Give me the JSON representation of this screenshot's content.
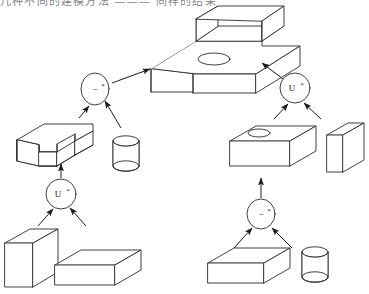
{
  "page": {
    "top_cut_text": "几种不同的建模方法 ——— 同样的结果"
  },
  "figure": {
    "background": "#ffffff",
    "stroke_color": "#2b2b2b",
    "face_color": "#ffffff",
    "arrow_color": "#1c1c1c"
  },
  "operators": [
    {
      "id": "op-difference-left",
      "symbol": "−",
      "star": "*",
      "name": "regularized-difference",
      "cx": 95,
      "cy": 89,
      "rx": 14,
      "ry": 16
    },
    {
      "id": "op-union-left",
      "symbol": "U",
      "star": "*",
      "name": "regularized-union",
      "cx": 61,
      "cy": 194,
      "rx": 15,
      "ry": 15
    },
    {
      "id": "op-union-right",
      "symbol": "U",
      "star": "*",
      "name": "regularized-union",
      "cx": 295,
      "cy": 88,
      "rx": 15,
      "ry": 15
    },
    {
      "id": "op-difference-right",
      "symbol": "−",
      "star": "*",
      "name": "regularized-difference",
      "cx": 261,
      "cy": 214,
      "rx": 14,
      "ry": 15
    }
  ],
  "solids": [
    {
      "id": "result-block",
      "label": "stepped block with through hole",
      "kind": "step-block-hole"
    },
    {
      "id": "u-channel",
      "label": "U channel",
      "kind": "u-channel"
    },
    {
      "id": "cylinder-left",
      "label": "cylinder",
      "kind": "cylinder"
    },
    {
      "id": "plate-left",
      "label": "vertical plate",
      "kind": "plate"
    },
    {
      "id": "box-left",
      "label": "rectangular box",
      "kind": "box"
    },
    {
      "id": "box-hole-right",
      "label": "box with elliptical hole",
      "kind": "box-hole"
    },
    {
      "id": "plate-right",
      "label": "vertical plate",
      "kind": "plate"
    },
    {
      "id": "box-bottom-right",
      "label": "rectangular box",
      "kind": "box"
    },
    {
      "id": "cylinder-right",
      "label": "cylinder",
      "kind": "cylinder"
    }
  ],
  "edges": [
    {
      "from": "op-difference-left",
      "to": "result-block",
      "name": "arrow-diff-left-to-result"
    },
    {
      "from": "op-union-right",
      "to": "result-block",
      "name": "arrow-union-right-to-result"
    },
    {
      "from": "u-channel",
      "to": "op-difference-left",
      "name": "arrow-uchannel-to-diff-left"
    },
    {
      "from": "cylinder-left",
      "to": "op-difference-left",
      "name": "arrow-cylinder-to-diff-left"
    },
    {
      "from": "op-union-left",
      "to": "u-channel",
      "name": "arrow-union-left-to-uchannel"
    },
    {
      "from": "plate-left",
      "to": "op-union-left",
      "name": "arrow-plate-to-union-left"
    },
    {
      "from": "box-left",
      "to": "op-union-left",
      "name": "arrow-box-to-union-left"
    },
    {
      "from": "box-hole-right",
      "to": "op-union-right",
      "name": "arrow-boxhole-to-union-right"
    },
    {
      "from": "plate-right",
      "to": "op-union-right",
      "name": "arrow-plate-to-union-right"
    },
    {
      "from": "op-difference-right",
      "to": "box-hole-right",
      "name": "arrow-diff-right-to-boxhole"
    },
    {
      "from": "box-bottom-right",
      "to": "op-difference-right",
      "name": "arrow-box-to-diff-right"
    },
    {
      "from": "cylinder-right",
      "to": "op-difference-right",
      "name": "arrow-cylinder-to-diff-right"
    }
  ]
}
